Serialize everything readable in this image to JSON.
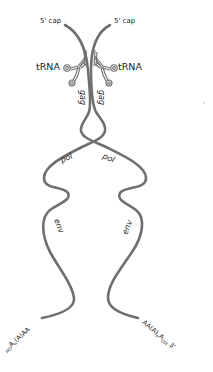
{
  "diagram": {
    "stroke_color": "#6f6f6f",
    "labels": {
      "left_cap": "5' cap",
      "right_cap": "5' cap",
      "left_trna": "tRNA",
      "right_trna": "tRNA",
      "left_gag": "gag",
      "right_gag": "gag",
      "left_pol": "pol",
      "right_pol": "pol",
      "left_env": "env",
      "right_env": "env",
      "left_tail_prefix": "HO",
      "left_tail_A": "A",
      "left_tail_sub": "n",
      "left_tail_rest": "(A)AA",
      "right_tail_head": "AA(A)",
      "right_tail_sub": "n",
      "right_tail_A": "A",
      "right_tail_sub2": "OH",
      "right_tail_end": " 3'"
    },
    "decoration": "small-dot"
  }
}
